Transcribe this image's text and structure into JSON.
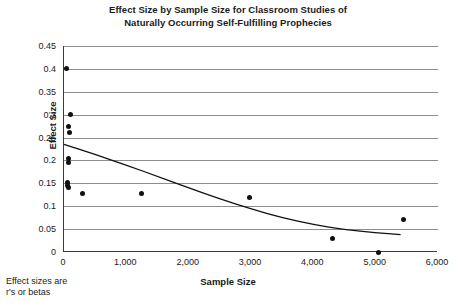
{
  "chart_data": {
    "type": "scatter",
    "title": "Effect Size by Sample Size for Classroom Studies of Naturally Occurring Self-Fulfilling Prophecies",
    "title_lines": [
      "Effect Size by Sample Size for Classroom Studies of",
      "Naturally Occurring Self-Fulfilling Prophecies"
    ],
    "xlabel": "Sample Size",
    "ylabel": "Effect Size",
    "xlim": [
      0,
      6000
    ],
    "ylim": [
      0,
      0.45
    ],
    "grid": "horizontal",
    "legend": "none",
    "xticks": [
      0,
      1000,
      2000,
      3000,
      4000,
      5000,
      6000
    ],
    "xtick_labels": [
      "0",
      "1,000",
      "2,000",
      "3,000",
      "4,000",
      "5,000",
      "6,000"
    ],
    "yticks": [
      0,
      0.05,
      0.1,
      0.15,
      0.2,
      0.25,
      0.3,
      0.35,
      0.4,
      0.45
    ],
    "ytick_labels": [
      "0",
      "0.05",
      "0.1",
      "0.15",
      "0.2",
      "0.25",
      "0.3",
      "0.35",
      "0.4",
      "0.45"
    ],
    "points": [
      {
        "x": 40,
        "y": 0.4
      },
      {
        "x": 110,
        "y": 0.3
      },
      {
        "x": 80,
        "y": 0.275
      },
      {
        "x": 95,
        "y": 0.26
      },
      {
        "x": 70,
        "y": 0.205
      },
      {
        "x": 70,
        "y": 0.195
      },
      {
        "x": 60,
        "y": 0.152
      },
      {
        "x": 60,
        "y": 0.145
      },
      {
        "x": 75,
        "y": 0.14
      },
      {
        "x": 300,
        "y": 0.128
      },
      {
        "x": 1250,
        "y": 0.128
      },
      {
        "x": 2980,
        "y": 0.12
      },
      {
        "x": 4300,
        "y": 0.03
      },
      {
        "x": 5050,
        "y": 0.0
      },
      {
        "x": 5450,
        "y": 0.07
      }
    ],
    "trend_curve": {
      "description": "fitted decreasing curve",
      "points": [
        {
          "x": 0,
          "y": 0.235
        },
        {
          "x": 500,
          "y": 0.213
        },
        {
          "x": 1000,
          "y": 0.19
        },
        {
          "x": 1500,
          "y": 0.165
        },
        {
          "x": 2000,
          "y": 0.14
        },
        {
          "x": 2500,
          "y": 0.116
        },
        {
          "x": 3000,
          "y": 0.094
        },
        {
          "x": 3500,
          "y": 0.075
        },
        {
          "x": 4000,
          "y": 0.06
        },
        {
          "x": 4500,
          "y": 0.049
        },
        {
          "x": 5000,
          "y": 0.042
        },
        {
          "x": 5400,
          "y": 0.038
        }
      ]
    },
    "annotations": {
      "footnote_lines": [
        "Effect sizes are",
        "r's or betas"
      ]
    }
  }
}
